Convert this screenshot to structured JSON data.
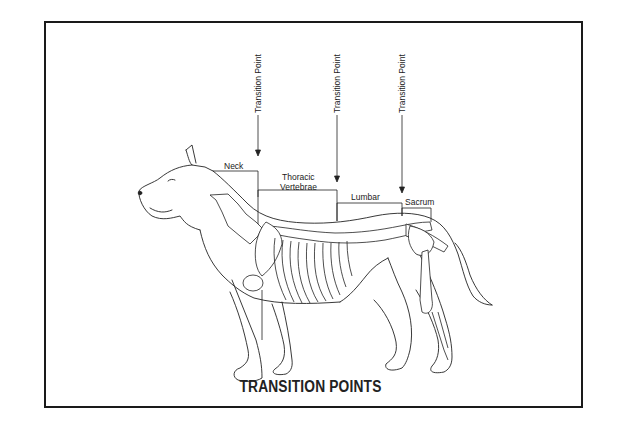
{
  "diagram": {
    "title": "TRANSITION POINTS",
    "transition_points": [
      {
        "label": "Transition Point"
      },
      {
        "label": "Transition Point"
      },
      {
        "label": "Transition Point"
      }
    ],
    "regions": [
      {
        "label": "Neck"
      },
      {
        "label": "Thoracic"
      },
      {
        "label": "Vertebrae"
      },
      {
        "label": "Lumbar"
      },
      {
        "label": "Sacrum"
      }
    ]
  }
}
